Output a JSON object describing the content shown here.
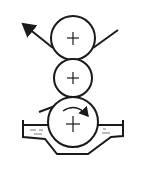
{
  "diagram": {
    "title": "",
    "colors": {
      "stroke": "#1a1a1a",
      "background": "#ffffff"
    },
    "rollers": [
      {
        "name": "top-roller",
        "cx": 73,
        "cy": 38,
        "r": 22
      },
      {
        "name": "middle-roller",
        "cx": 73,
        "cy": 78,
        "r": 19
      },
      {
        "name": "bottom-roller",
        "cx": 73,
        "cy": 122,
        "r": 25
      }
    ],
    "web": {
      "direction": "enters from upper right, exits to upper left",
      "arrow": "arrow-up-left"
    },
    "rotation_arrow": {
      "direction": "clockwise",
      "on": "bottom-roller"
    },
    "trough": {
      "contains": "liquid"
    }
  }
}
